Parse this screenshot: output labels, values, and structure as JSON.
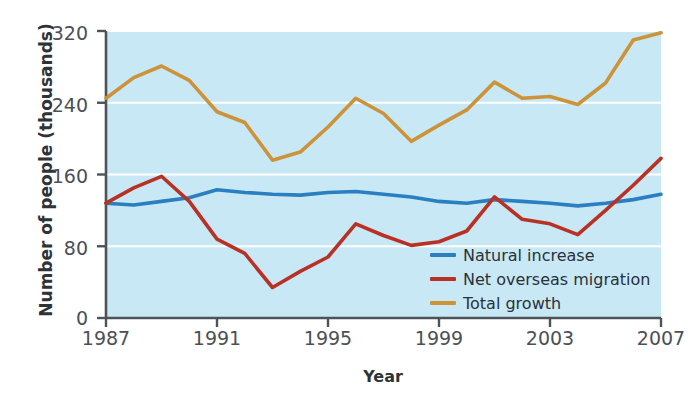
{
  "chart_data": {
    "type": "line",
    "title": "",
    "xlabel": "Year",
    "ylabel": "Number of people (thousands)",
    "xlim": [
      1987,
      2007
    ],
    "ylim": [
      0,
      320
    ],
    "yticks": [
      0,
      80,
      160,
      240,
      320
    ],
    "xticks": [
      1987,
      1991,
      1995,
      1999,
      2003,
      2007
    ],
    "grid": true,
    "grid_axis": "y",
    "legend_position": "lower right",
    "plot_background": "#c8e8f5",
    "x": [
      1987,
      1988,
      1989,
      1990,
      1991,
      1992,
      1993,
      1994,
      1995,
      1996,
      1997,
      1998,
      1999,
      2000,
      2001,
      2002,
      2003,
      2004,
      2005,
      2006,
      2007
    ],
    "series": [
      {
        "name": "Natural increase",
        "color": "#2a7fc1",
        "values": [
          128,
          126,
          130,
          134,
          143,
          140,
          138,
          137,
          140,
          141,
          138,
          135,
          130,
          128,
          132,
          130,
          128,
          125,
          128,
          132,
          138
        ]
      },
      {
        "name": "Net overseas migration",
        "color": "#b93124",
        "values": [
          128,
          145,
          158,
          130,
          88,
          72,
          34,
          52,
          68,
          105,
          92,
          81,
          85,
          97,
          135,
          110,
          105,
          93,
          120,
          148,
          178
        ]
      },
      {
        "name": "Total growth",
        "color": "#cc9338",
        "values": [
          245,
          268,
          281,
          265,
          230,
          218,
          176,
          185,
          213,
          245,
          228,
          197,
          215,
          232,
          263,
          245,
          247,
          238,
          262,
          310,
          318
        ]
      }
    ]
  },
  "axis": {
    "y_label": "Number of people (thousands)",
    "x_label": "Year",
    "y_tick_labels": [
      "320",
      "240",
      "160",
      "80",
      "0"
    ],
    "x_tick_labels": [
      "1987",
      "1991",
      "1995",
      "1999",
      "2003",
      "2007"
    ]
  },
  "legend": {
    "items": [
      {
        "label": "Natural increase",
        "color": "#2a7fc1"
      },
      {
        "label": "Net overseas migration",
        "color": "#b93124"
      },
      {
        "label": "Total growth",
        "color": "#cc9338"
      }
    ]
  }
}
